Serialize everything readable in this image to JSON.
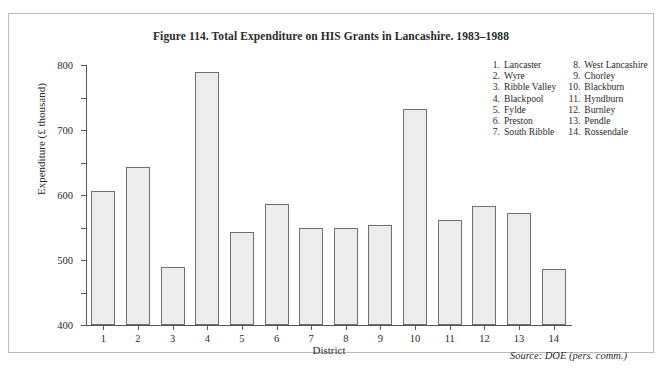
{
  "figure": {
    "title": "Figure 114.  Total Expenditure on HIS Grants in Lancashire. 1983–1988",
    "source_note": "Source: DOE (pers. comm.)",
    "frame_color": "#b9b9b9",
    "bar_fill_color": "#ececec",
    "bar_border_color": "#6e6e6e",
    "axis_color": "#555555"
  },
  "legend": {
    "columns": [
      [
        {
          "num": "1.",
          "label": "Lancaster"
        },
        {
          "num": "2.",
          "label": "Wyre"
        },
        {
          "num": "3.",
          "label": "Ribble Valley"
        },
        {
          "num": "4.",
          "label": "Blackpool"
        },
        {
          "num": "5.",
          "label": "Fylde"
        },
        {
          "num": "6.",
          "label": "Preston"
        },
        {
          "num": "7.",
          "label": "South Ribble"
        }
      ],
      [
        {
          "num": "8.",
          "label": "West Lancashire"
        },
        {
          "num": "9.",
          "label": "Chorley"
        },
        {
          "num": "10.",
          "label": "Blackburn"
        },
        {
          "num": "11.",
          "label": "Hyndburn"
        },
        {
          "num": "12.",
          "label": "Burnley"
        },
        {
          "num": "13.",
          "label": "Pendle"
        },
        {
          "num": "14.",
          "label": "Rossendale"
        }
      ]
    ]
  },
  "chart_data": {
    "type": "bar",
    "title": "Figure 114.  Total Expenditure on HIS Grants in Lancashire. 1983–1988",
    "xlabel": "District",
    "ylabel": "Expenditure (£ thousand)",
    "ylim": [
      0,
      800
    ],
    "yticks": [
      0,
      100,
      200,
      300,
      400,
      500,
      600,
      700,
      800
    ],
    "ytick_labels": [
      "0",
      "100",
      "200",
      "300",
      "400",
      "500",
      "600",
      "700",
      "800"
    ],
    "grid": false,
    "legend_position": "top-right",
    "categories": [
      "1",
      "2",
      "3",
      "4",
      "5",
      "6",
      "7",
      "8",
      "9",
      "10",
      "11",
      "12",
      "13",
      "14"
    ],
    "category_names": [
      "Lancaster",
      "Wyre",
      "Ribble Valley",
      "Blackpool",
      "Fylde",
      "Preston",
      "South Ribble",
      "West Lancashire",
      "Chorley",
      "Blackburn",
      "Hyndburn",
      "Burnley",
      "Pendle",
      "Rossendale"
    ],
    "values": [
      412,
      485,
      177,
      777,
      285,
      373,
      300,
      300,
      307,
      665,
      322,
      367,
      345,
      172
    ]
  }
}
